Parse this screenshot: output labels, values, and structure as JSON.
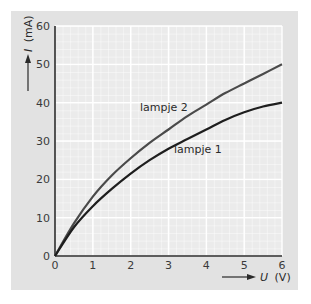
{
  "chart_data": {
    "type": "line",
    "title": "",
    "xlabel": "U (V)",
    "ylabel": "I (mA)",
    "xlim": [
      0,
      6
    ],
    "ylim": [
      0,
      60
    ],
    "x_ticks": [
      "0",
      "1",
      "2",
      "3",
      "4",
      "5",
      "6"
    ],
    "y_ticks": [
      "0",
      "10",
      "20",
      "30",
      "40",
      "50",
      "60"
    ],
    "grid": true,
    "legend": "inline labels",
    "x": [
      0,
      0.5,
      1,
      1.5,
      2,
      2.5,
      3,
      3.5,
      4,
      4.5,
      5,
      5.5,
      6
    ],
    "series": [
      {
        "name": "lampje 2",
        "color": "#4a4a4a",
        "values": [
          0,
          8.5,
          15.5,
          21,
          25.5,
          29.5,
          33,
          36.5,
          39.5,
          42.5,
          45,
          47.5,
          50
        ]
      },
      {
        "name": "lampje 1",
        "color": "#1e1e1e",
        "values": [
          0,
          7.5,
          13,
          17.5,
          21.5,
          25,
          28,
          30.5,
          33,
          35.5,
          37.5,
          39,
          40
        ]
      }
    ]
  },
  "labels": {
    "y_axis_symbol": "I",
    "y_axis_unit": "(mA)",
    "x_axis_symbol": "U",
    "x_axis_unit": "(V)",
    "series_1": "lampje 1",
    "series_2": "lampje 2"
  }
}
